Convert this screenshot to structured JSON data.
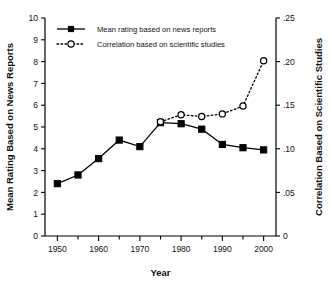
{
  "chart_data": {
    "type": "line",
    "title": "",
    "xlabel": "Year",
    "ylabel": "Mean Rating Based on News Reports",
    "y2label": "Correlation Based on Scientific Studies",
    "x": [
      1950,
      1955,
      1960,
      1965,
      1970,
      1975,
      1980,
      1985,
      1990,
      1995,
      2000
    ],
    "xlim": [
      1947,
      2003
    ],
    "xticks_major": [
      1950,
      1960,
      1970,
      1980,
      1990,
      2000
    ],
    "xticks_minor": [
      1955,
      1965,
      1975,
      1985,
      1995
    ],
    "xtick_labels": [
      "1950",
      "1960",
      "1970",
      "1980",
      "1990",
      "2000"
    ],
    "ylim": [
      0,
      10
    ],
    "yticks": [
      0,
      1,
      2,
      3,
      4,
      5,
      6,
      7,
      8,
      9,
      10
    ],
    "ytick_labels": [
      "0",
      "1",
      "2",
      "3",
      "4",
      "5",
      "6",
      "7",
      "8",
      "9",
      "10"
    ],
    "y2lim": [
      0,
      0.25
    ],
    "y2ticks": [
      0,
      0.05,
      0.1,
      0.15,
      0.2,
      0.25
    ],
    "y2tick_labels": [
      "0",
      ".05",
      ".10",
      ".15",
      ".20",
      ".25"
    ],
    "grid": false,
    "legend_position": "top-left",
    "series": [
      {
        "name": "Mean rating based on news reports",
        "axis": "left",
        "style": "solid",
        "marker": "filled-square",
        "color": "#000000",
        "x": [
          1950,
          1955,
          1960,
          1965,
          1970,
          1975,
          1980,
          1985,
          1990,
          1995,
          2000
        ],
        "values": [
          2.4,
          2.8,
          3.55,
          4.4,
          4.1,
          5.2,
          5.15,
          4.9,
          4.2,
          4.05,
          3.95
        ]
      },
      {
        "name": "Correlation based on scientific studies",
        "axis": "right",
        "style": "dotted",
        "marker": "open-circle",
        "color": "#000000",
        "x": [
          1975,
          1980,
          1985,
          1990,
          1995,
          2000
        ],
        "values": [
          0.131,
          0.139,
          0.137,
          0.14,
          0.149,
          0.201
        ]
      }
    ]
  },
  "legend": {
    "items": [
      {
        "label": "Mean rating based on news reports"
      },
      {
        "label": "Correlation based on scientific studies"
      }
    ]
  }
}
